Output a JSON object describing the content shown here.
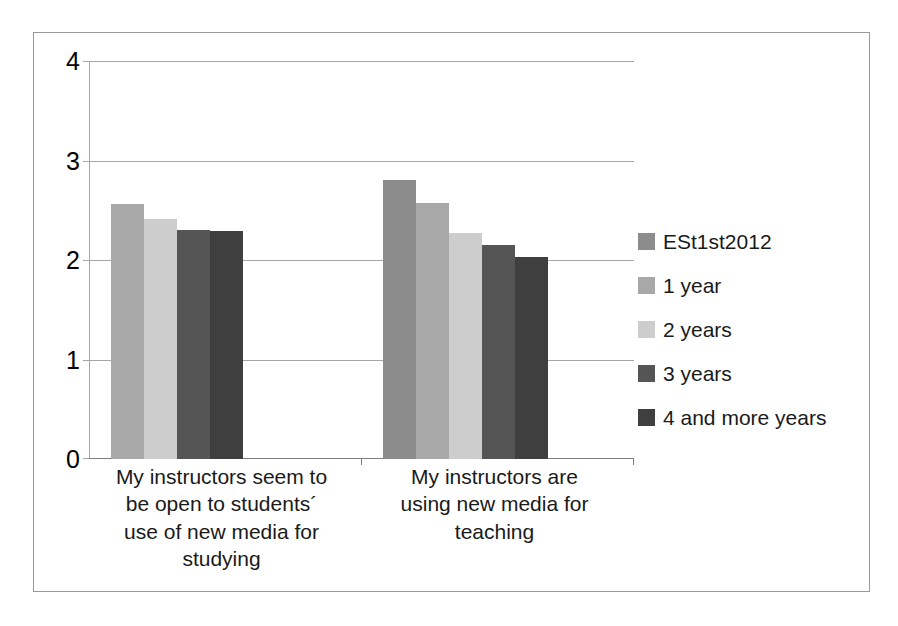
{
  "chart_data": {
    "type": "bar",
    "title": "",
    "xlabel": "",
    "ylabel": "",
    "ylim": [
      0,
      4
    ],
    "yticks": [
      0,
      1,
      2,
      3,
      4
    ],
    "ytick_labels": [
      "0",
      "1",
      "2",
      "3",
      "4"
    ],
    "grid": true,
    "legend_position": "right",
    "categories": [
      "My instructors seem to be open to students´ use of new media for studying",
      "My instructors are using new media for teaching"
    ],
    "series": [
      {
        "name": "ESt1st2012",
        "color": "#8c8c8c",
        "values": [
          null,
          2.81
        ]
      },
      {
        "name": "1 year",
        "color": "#a8a8a8",
        "values": [
          2.57,
          2.58
        ]
      },
      {
        "name": "2 years",
        "color": "#cdcdcd",
        "values": [
          2.42,
          2.28
        ]
      },
      {
        "name": "3 years",
        "color": "#555555",
        "values": [
          2.31,
          2.16
        ]
      },
      {
        "name": "4 and more years",
        "color": "#3f3f3f",
        "values": [
          2.3,
          2.04
        ]
      }
    ]
  },
  "axis": {
    "y_tick_0": "0",
    "y_tick_1": "1",
    "y_tick_2": "2",
    "y_tick_3": "3",
    "y_tick_4": "4"
  },
  "categories": {
    "cat_0_line_0": "My instructors seem to",
    "cat_0_line_1": "be open to students´",
    "cat_0_line_2": "use of new media for",
    "cat_0_line_3": "studying",
    "cat_1_line_0": "My instructors are",
    "cat_1_line_1": "using new media for",
    "cat_1_line_2": "teaching"
  },
  "legend": {
    "items": [
      {
        "label": "ESt1st2012",
        "color": "#8c8c8c"
      },
      {
        "label": "1 year",
        "color": "#a8a8a8"
      },
      {
        "label": "2 years",
        "color": "#cdcdcd"
      },
      {
        "label": "3 years",
        "color": "#555555"
      },
      {
        "label": "4 and more years",
        "color": "#3f3f3f"
      }
    ]
  }
}
